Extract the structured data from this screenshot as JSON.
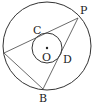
{
  "diagram": {
    "type": "geometry",
    "outer_circle": {
      "cx": 47,
      "cy": 46,
      "r": 44
    },
    "inner_circle": {
      "cx": 47,
      "cy": 48,
      "r": 15
    },
    "points": {
      "A": {
        "x": 4,
        "y": 53
      },
      "B": {
        "x": 43,
        "y": 89
      },
      "P": {
        "x": 78,
        "y": 18
      }
    },
    "labels": {
      "P": "P",
      "C": "C",
      "O": "O",
      "D": "D",
      "B": "B"
    },
    "colors": {
      "line": "#333333",
      "background": "#ffffff"
    }
  }
}
